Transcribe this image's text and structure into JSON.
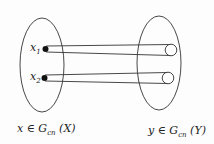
{
  "diagram": {
    "left_set": {
      "label_var": "x",
      "label_in": " ∈ ",
      "label_G": "G",
      "label_sub": "cn",
      "label_arg": " (X)",
      "points": [
        {
          "var": "x",
          "sub": "1"
        },
        {
          "var": "x",
          "sub": "2"
        }
      ]
    },
    "right_set": {
      "label_var": "y",
      "label_in": " ∈ ",
      "label_G": "G",
      "label_sub": "cn",
      "label_arg": " (Y)"
    },
    "colors": {
      "stroke": "#333333",
      "dot": "#111111"
    }
  }
}
